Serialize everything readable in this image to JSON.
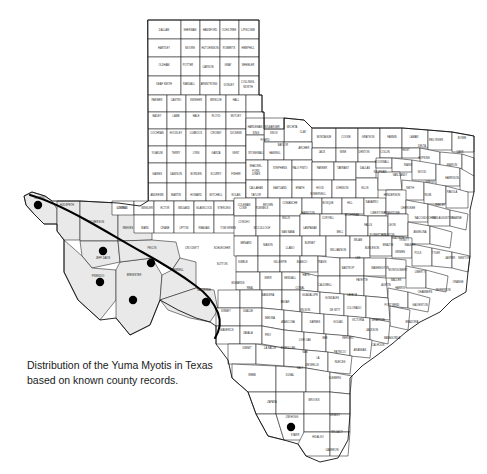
{
  "figure": {
    "caption_line1": "Distribution of the Yuma Myotis in Texas",
    "caption_line2": "based on known county records.",
    "caption_full": "Distribution of the Yuma Myotis in Texas\nbased on known county records.",
    "species": "Yuma Myotis",
    "region": "Texas",
    "background_color": "#ffffff",
    "shaded_range_color": "#e9e9e9",
    "county_line_color": "#1a1a1a",
    "record_dot_color": "#000000",
    "range_boundary_color": "#000000"
  },
  "map": {
    "title": "Texas county map",
    "type": "distribution-map",
    "shaded_range_label": "Presumed distribution (shaded)",
    "dot_legend_label": "Known county record"
  },
  "record_dots": [
    {
      "county": "El Paso",
      "x": 38,
      "y": 205,
      "r": 4.2
    },
    {
      "county": "Jeff Davis",
      "x": 103,
      "y": 251,
      "r": 4.2
    },
    {
      "county": "Presidio",
      "x": 100,
      "y": 282,
      "r": 4.2
    },
    {
      "county": "Brewster",
      "x": 133,
      "y": 300,
      "r": 4.2
    },
    {
      "county": "Pecos",
      "x": 151,
      "y": 263,
      "r": 4.2
    },
    {
      "county": "Val Verde",
      "x": 206,
      "y": 302,
      "r": 4.2
    },
    {
      "county": "Starr",
      "x": 291,
      "y": 427,
      "r": 4.2
    }
  ],
  "shaded_counties": [
    "El Paso",
    "Hudspeth",
    "Culberson",
    "Jeff Davis",
    "Presidio",
    "Brewster",
    "Pecos",
    "Terrell",
    "Val Verde"
  ],
  "county_labels": [
    {
      "name": "DALLAM",
      "x": 164,
      "y": 30
    },
    {
      "name": "SHERMAN",
      "x": 190,
      "y": 30
    },
    {
      "name": "HANSFORD",
      "x": 210,
      "y": 30
    },
    {
      "name": "OCHILTREE",
      "x": 229,
      "y": 30
    },
    {
      "name": "LIPSCOMB",
      "x": 248,
      "y": 30
    },
    {
      "name": "HARTLEY",
      "x": 164,
      "y": 48
    },
    {
      "name": "MOORE",
      "x": 190,
      "y": 48
    },
    {
      "name": "HUTCHINSON",
      "x": 210,
      "y": 48
    },
    {
      "name": "ROBERTS",
      "x": 229,
      "y": 48
    },
    {
      "name": "HEMPHILL",
      "x": 248,
      "y": 48
    },
    {
      "name": "OLDHAM",
      "x": 164,
      "y": 65
    },
    {
      "name": "POTTER",
      "x": 188,
      "y": 65
    },
    {
      "name": "CARSON",
      "x": 208,
      "y": 67
    },
    {
      "name": "GRAY",
      "x": 228,
      "y": 65
    },
    {
      "name": "WHEELER",
      "x": 248,
      "y": 65
    },
    {
      "name": "DEAF SMITH",
      "x": 164,
      "y": 84
    },
    {
      "name": "RANDALL",
      "x": 189,
      "y": 84
    },
    {
      "name": "ARMSTRONG",
      "x": 209,
      "y": 84
    },
    {
      "name": "DONLEY",
      "x": 229,
      "y": 85
    },
    {
      "name": "COLLINGS-",
      "x": 248,
      "y": 82
    },
    {
      "name": "WORTH",
      "x": 248,
      "y": 87
    },
    {
      "name": "PARMER",
      "x": 157,
      "y": 100
    },
    {
      "name": "CASTRO",
      "x": 176,
      "y": 100
    },
    {
      "name": "SWISHER",
      "x": 196,
      "y": 100
    },
    {
      "name": "BRISCOE",
      "x": 216,
      "y": 100
    },
    {
      "name": "HALL",
      "x": 236,
      "y": 100
    },
    {
      "name": "BAILEY",
      "x": 157,
      "y": 116
    },
    {
      "name": "LAMB",
      "x": 176,
      "y": 116
    },
    {
      "name": "HALE",
      "x": 196,
      "y": 116
    },
    {
      "name": "FLOYD",
      "x": 216,
      "y": 116
    },
    {
      "name": "MOTLEY",
      "x": 236,
      "y": 116
    },
    {
      "name": "COCHRAN",
      "x": 157,
      "y": 133
    },
    {
      "name": "HOCKLEY",
      "x": 176,
      "y": 133
    },
    {
      "name": "LUBBOCK",
      "x": 196,
      "y": 133
    },
    {
      "name": "CROSBY",
      "x": 216,
      "y": 133
    },
    {
      "name": "DICKENS",
      "x": 236,
      "y": 133
    },
    {
      "name": "KING",
      "x": 256,
      "y": 133
    },
    {
      "name": "KNOX",
      "x": 274,
      "y": 133
    },
    {
      "name": "YOAKUM",
      "x": 157,
      "y": 153
    },
    {
      "name": "TERRY",
      "x": 176,
      "y": 153
    },
    {
      "name": "LYNN",
      "x": 196,
      "y": 153
    },
    {
      "name": "GARZA",
      "x": 216,
      "y": 153
    },
    {
      "name": "KENT",
      "x": 236,
      "y": 153
    },
    {
      "name": "STONEWALL",
      "x": 256,
      "y": 153
    },
    {
      "name": "HASKELL",
      "x": 275,
      "y": 153
    },
    {
      "name": "GAINES",
      "x": 157,
      "y": 174
    },
    {
      "name": "DAWSON",
      "x": 176,
      "y": 174
    },
    {
      "name": "BORDEN",
      "x": 196,
      "y": 174
    },
    {
      "name": "SCURRY",
      "x": 216,
      "y": 174
    },
    {
      "name": "FISHER",
      "x": 236,
      "y": 174
    },
    {
      "name": "JONES",
      "x": 256,
      "y": 174
    },
    {
      "name": "ANDREWS",
      "x": 157,
      "y": 195
    },
    {
      "name": "MARTIN",
      "x": 176,
      "y": 195
    },
    {
      "name": "HOWARD",
      "x": 196,
      "y": 195
    },
    {
      "name": "MITCHELL",
      "x": 216,
      "y": 195
    },
    {
      "name": "NOLAN",
      "x": 236,
      "y": 195
    },
    {
      "name": "TAYLOR",
      "x": 256,
      "y": 195
    },
    {
      "name": "EL PASO",
      "x": 40,
      "y": 198
    },
    {
      "name": "HUDSPETH",
      "x": 67,
      "y": 205
    },
    {
      "name": "CULBERSON",
      "x": 96,
      "y": 222
    },
    {
      "name": "REEVES",
      "x": 128,
      "y": 228
    },
    {
      "name": "LOVING",
      "x": 122,
      "y": 208
    },
    {
      "name": "WINKLER",
      "x": 147,
      "y": 208
    },
    {
      "name": "WARD",
      "x": 145,
      "y": 228
    },
    {
      "name": "ECTOR",
      "x": 165,
      "y": 208
    },
    {
      "name": "MIDLAND",
      "x": 184,
      "y": 208
    },
    {
      "name": "GLASSCOCK",
      "x": 204,
      "y": 208
    },
    {
      "name": "STERLING",
      "x": 224,
      "y": 208
    },
    {
      "name": "COKE",
      "x": 243,
      "y": 208
    },
    {
      "name": "RUNNELS",
      "x": 262,
      "y": 208
    },
    {
      "name": "CRANE",
      "x": 165,
      "y": 228
    },
    {
      "name": "UPTON",
      "x": 184,
      "y": 228
    },
    {
      "name": "REAGAN",
      "x": 204,
      "y": 228
    },
    {
      "name": "TOM GREEN",
      "x": 228,
      "y": 228
    },
    {
      "name": "JEFF DAVIS",
      "x": 103,
      "y": 258
    },
    {
      "name": "PRESIDIO",
      "x": 98,
      "y": 276
    },
    {
      "name": "BREWSTER",
      "x": 134,
      "y": 275
    },
    {
      "name": "PECOS",
      "x": 152,
      "y": 248
    },
    {
      "name": "CROCKETT",
      "x": 192,
      "y": 248
    },
    {
      "name": "SCHLEICHER",
      "x": 222,
      "y": 248
    },
    {
      "name": "SUTTON",
      "x": 222,
      "y": 264
    },
    {
      "name": "TERRELL",
      "x": 178,
      "y": 270
    },
    {
      "name": "VAL VERDE",
      "x": 204,
      "y": 290
    },
    {
      "name": "KIMBLE",
      "x": 243,
      "y": 262
    },
    {
      "name": "EDWARDS",
      "x": 238,
      "y": 283
    },
    {
      "name": "KINNEY",
      "x": 226,
      "y": 311
    },
    {
      "name": "UVALDE",
      "x": 248,
      "y": 311
    },
    {
      "name": "MEDINA",
      "x": 270,
      "y": 318
    },
    {
      "name": "MAVERICK",
      "x": 227,
      "y": 330
    },
    {
      "name": "ZAVALA",
      "x": 248,
      "y": 333
    },
    {
      "name": "FRIO",
      "x": 268,
      "y": 335
    },
    {
      "name": "DIMMIT",
      "x": 247,
      "y": 348
    },
    {
      "name": "LA SALLE",
      "x": 270,
      "y": 348
    },
    {
      "name": "WEBB",
      "x": 252,
      "y": 375
    },
    {
      "name": "DUVAL",
      "x": 290,
      "y": 375
    },
    {
      "name": "ZAPATA",
      "x": 272,
      "y": 402
    },
    {
      "name": "JIM HOGG",
      "x": 292,
      "y": 417
    },
    {
      "name": "STARR",
      "x": 295,
      "y": 435
    },
    {
      "name": "BROOKS",
      "x": 314,
      "y": 400
    },
    {
      "name": "HIDALGO",
      "x": 318,
      "y": 437
    },
    {
      "name": "KENEDY",
      "x": 335,
      "y": 415
    },
    {
      "name": "WILLACY",
      "x": 337,
      "y": 432
    },
    {
      "name": "CAMERON",
      "x": 332,
      "y": 450
    },
    {
      "name": "COLORADO",
      "x": 354,
      "y": 308
    },
    {
      "name": "WHARTON",
      "x": 378,
      "y": 320
    },
    {
      "name": "MATAGORDA",
      "x": 392,
      "y": 338
    },
    {
      "name": "BRAZORIA",
      "x": 412,
      "y": 322
    },
    {
      "name": "FORT BEND",
      "x": 392,
      "y": 305
    },
    {
      "name": "HARRIS",
      "x": 400,
      "y": 288
    },
    {
      "name": "GALVESTON",
      "x": 420,
      "y": 305
    },
    {
      "name": "MONTGOMERY",
      "x": 398,
      "y": 270
    },
    {
      "name": "LIBERTY",
      "x": 420,
      "y": 272
    },
    {
      "name": "POLK",
      "x": 418,
      "y": 253
    },
    {
      "name": "TYLER",
      "x": 436,
      "y": 253
    },
    {
      "name": "JASPER",
      "x": 450,
      "y": 258
    },
    {
      "name": "NEWTON",
      "x": 464,
      "y": 258
    },
    {
      "name": "ORANGE",
      "x": 458,
      "y": 282
    },
    {
      "name": "JEFFERSON",
      "x": 443,
      "y": 290
    },
    {
      "name": "CHAMBERS",
      "x": 425,
      "y": 292
    },
    {
      "name": "TRINITY",
      "x": 404,
      "y": 240
    },
    {
      "name": "HOUSTON",
      "x": 388,
      "y": 235
    },
    {
      "name": "ANGELINA",
      "x": 420,
      "y": 232
    },
    {
      "name": "NACOGDOCHES",
      "x": 425,
      "y": 218
    },
    {
      "name": "SAN AUGUSTINE",
      "x": 443,
      "y": 218
    },
    {
      "name": "SABINE",
      "x": 457,
      "y": 218
    },
    {
      "name": "SHELBY",
      "x": 440,
      "y": 205
    },
    {
      "name": "PANOLA",
      "x": 452,
      "y": 192
    },
    {
      "name": "RUSK",
      "x": 428,
      "y": 195
    },
    {
      "name": "CHEROKEE",
      "x": 408,
      "y": 208
    },
    {
      "name": "SMITH",
      "x": 410,
      "y": 188
    },
    {
      "name": "GREGG",
      "x": 430,
      "y": 182
    },
    {
      "name": "HARRISON",
      "x": 452,
      "y": 178
    },
    {
      "name": "MARION",
      "x": 452,
      "y": 165
    },
    {
      "name": "CASS",
      "x": 460,
      "y": 152
    },
    {
      "name": "BOWIE",
      "x": 462,
      "y": 138
    },
    {
      "name": "RED RIVER",
      "x": 436,
      "y": 140
    },
    {
      "name": "LAMAR",
      "x": 414,
      "y": 137
    },
    {
      "name": "FANNIN",
      "x": 392,
      "y": 137
    },
    {
      "name": "GRAYSON",
      "x": 368,
      "y": 137
    },
    {
      "name": "COOKE",
      "x": 346,
      "y": 137
    },
    {
      "name": "MONTAGUE",
      "x": 324,
      "y": 137
    },
    {
      "name": "CLAY",
      "x": 303,
      "y": 132
    },
    {
      "name": "WICHITA",
      "x": 292,
      "y": 127
    },
    {
      "name": "WILBARGER",
      "x": 272,
      "y": 127
    },
    {
      "name": "HARDEMAN",
      "x": 255,
      "y": 127
    },
    {
      "name": "FOARD",
      "x": 265,
      "y": 140
    },
    {
      "name": "BAYLOR",
      "x": 283,
      "y": 145
    },
    {
      "name": "ARCHER",
      "x": 304,
      "y": 148
    },
    {
      "name": "JACK",
      "x": 322,
      "y": 152
    },
    {
      "name": "WISE",
      "x": 343,
      "y": 152
    },
    {
      "name": "DENTON",
      "x": 364,
      "y": 152
    },
    {
      "name": "COLLIN",
      "x": 385,
      "y": 152
    },
    {
      "name": "HUNT",
      "x": 406,
      "y": 150
    },
    {
      "name": "DELTA",
      "x": 422,
      "y": 146
    },
    {
      "name": "HOPKINS",
      "x": 424,
      "y": 158
    },
    {
      "name": "RAINS",
      "x": 408,
      "y": 165
    },
    {
      "name": "WOOD",
      "x": 422,
      "y": 172
    },
    {
      "name": "VAN ZANDT",
      "x": 400,
      "y": 175
    },
    {
      "name": "KAUFMAN",
      "x": 380,
      "y": 172
    },
    {
      "name": "ROCKWALL",
      "x": 382,
      "y": 162
    },
    {
      "name": "DALLAS",
      "x": 365,
      "y": 168
    },
    {
      "name": "TARRANT",
      "x": 343,
      "y": 168
    },
    {
      "name": "PARKER",
      "x": 322,
      "y": 168
    },
    {
      "name": "PALO PINTO",
      "x": 300,
      "y": 168
    },
    {
      "name": "STEPHENS",
      "x": 280,
      "y": 168
    },
    {
      "name": "SHACKEL-",
      "x": 256,
      "y": 166
    },
    {
      "name": "FORD",
      "x": 256,
      "y": 171
    },
    {
      "name": "CALLAHAN",
      "x": 256,
      "y": 188
    },
    {
      "name": "EASTLAND",
      "x": 280,
      "y": 188
    },
    {
      "name": "ERATH",
      "x": 300,
      "y": 188
    },
    {
      "name": "HOOD",
      "x": 320,
      "y": 188
    },
    {
      "name": "JOHNSON",
      "x": 342,
      "y": 188
    },
    {
      "name": "ELLIS",
      "x": 365,
      "y": 188
    },
    {
      "name": "HENDERSON",
      "x": 392,
      "y": 195
    },
    {
      "name": "NAVARRO",
      "x": 372,
      "y": 202
    },
    {
      "name": "HILL",
      "x": 350,
      "y": 203
    },
    {
      "name": "BOSQUE",
      "x": 328,
      "y": 203
    },
    {
      "name": "SOMERVELL",
      "x": 318,
      "y": 194
    },
    {
      "name": "COMANCHE",
      "x": 290,
      "y": 203
    },
    {
      "name": "BROWN",
      "x": 268,
      "y": 205
    },
    {
      "name": "COLEMAN",
      "x": 244,
      "y": 205
    },
    {
      "name": "MILLS",
      "x": 286,
      "y": 218
    },
    {
      "name": "HAMILTON",
      "x": 308,
      "y": 213
    },
    {
      "name": "CORYELL",
      "x": 328,
      "y": 218
    },
    {
      "name": "MCLENNAN",
      "x": 352,
      "y": 215
    },
    {
      "name": "FALLS",
      "x": 368,
      "y": 225
    },
    {
      "name": "LIMESTONE",
      "x": 378,
      "y": 213
    },
    {
      "name": "FREESTONE",
      "x": 392,
      "y": 213
    },
    {
      "name": "LEON",
      "x": 392,
      "y": 225
    },
    {
      "name": "ROBERTSON",
      "x": 378,
      "y": 235
    },
    {
      "name": "MILAM",
      "x": 358,
      "y": 240
    },
    {
      "name": "BELL",
      "x": 340,
      "y": 232
    },
    {
      "name": "LAMPASAS",
      "x": 310,
      "y": 228
    },
    {
      "name": "BURNET",
      "x": 310,
      "y": 243
    },
    {
      "name": "SAN SABA",
      "x": 288,
      "y": 232
    },
    {
      "name": "MCCULLOCH",
      "x": 262,
      "y": 228
    },
    {
      "name": "CONCHO",
      "x": 244,
      "y": 222
    },
    {
      "name": "MENARD",
      "x": 246,
      "y": 243
    },
    {
      "name": "MASON",
      "x": 268,
      "y": 245
    },
    {
      "name": "LLANO",
      "x": 290,
      "y": 248
    },
    {
      "name": "WILLIAMSON",
      "x": 338,
      "y": 250
    },
    {
      "name": "BURLESON",
      "x": 372,
      "y": 248
    },
    {
      "name": "BRAZOS",
      "x": 388,
      "y": 245
    },
    {
      "name": "GRIMES",
      "x": 400,
      "y": 252
    },
    {
      "name": "WALKER",
      "x": 410,
      "y": 245
    },
    {
      "name": "MADISON",
      "x": 398,
      "y": 238
    },
    {
      "name": "TRAVIS",
      "x": 322,
      "y": 262
    },
    {
      "name": "BASTROP",
      "x": 348,
      "y": 268
    },
    {
      "name": "LEE",
      "x": 358,
      "y": 258
    },
    {
      "name": "FAYETTE",
      "x": 362,
      "y": 280
    },
    {
      "name": "WASHINGTON",
      "x": 380,
      "y": 268
    },
    {
      "name": "AUSTIN",
      "x": 386,
      "y": 285
    },
    {
      "name": "WALLER",
      "x": 396,
      "y": 280
    },
    {
      "name": "HAYS",
      "x": 306,
      "y": 275
    },
    {
      "name": "BLANCO",
      "x": 302,
      "y": 262
    },
    {
      "name": "GILLESPIE",
      "x": 280,
      "y": 262
    },
    {
      "name": "KERR",
      "x": 268,
      "y": 278
    },
    {
      "name": "KENDALL",
      "x": 290,
      "y": 278
    },
    {
      "name": "COMAL",
      "x": 300,
      "y": 288
    },
    {
      "name": "BANDERA",
      "x": 268,
      "y": 295
    },
    {
      "name": "REAL",
      "x": 250,
      "y": 288
    },
    {
      "name": "BEXAR",
      "x": 285,
      "y": 302
    },
    {
      "name": "GUADALUPE",
      "x": 310,
      "y": 295
    },
    {
      "name": "CALDWELL",
      "x": 325,
      "y": 285
    },
    {
      "name": "GONZALES",
      "x": 332,
      "y": 298
    },
    {
      "name": "LAVACA",
      "x": 352,
      "y": 295
    },
    {
      "name": "DE WITT",
      "x": 335,
      "y": 310
    },
    {
      "name": "WILSON",
      "x": 305,
      "y": 310
    },
    {
      "name": "ATASCOSA",
      "x": 288,
      "y": 322
    },
    {
      "name": "KARNES",
      "x": 315,
      "y": 322
    },
    {
      "name": "GOLIAD",
      "x": 338,
      "y": 322
    },
    {
      "name": "VICTORIA",
      "x": 358,
      "y": 320
    },
    {
      "name": "JACKSON",
      "x": 372,
      "y": 330
    },
    {
      "name": "CALHOUN",
      "x": 378,
      "y": 345
    },
    {
      "name": "REFUGIO",
      "x": 348,
      "y": 338
    },
    {
      "name": "BEE",
      "x": 325,
      "y": 338
    },
    {
      "name": "LIVE OAK",
      "x": 305,
      "y": 340
    },
    {
      "name": "MCMULLEN",
      "x": 288,
      "y": 348
    },
    {
      "name": "SAN",
      "x": 305,
      "y": 352
    },
    {
      "name": "PATRICIO",
      "x": 340,
      "y": 352
    },
    {
      "name": "ARANSAS",
      "x": 360,
      "y": 350
    },
    {
      "name": "NUECES",
      "x": 340,
      "y": 362
    },
    {
      "name": "JIM WELLS",
      "x": 312,
      "y": 365
    },
    {
      "name": "KLEBERG",
      "x": 335,
      "y": 378
    },
    {
      "name": "LA",
      "x": 318,
      "y": 358
    },
    {
      "name": "SALT",
      "x": 300,
      "y": 368
    },
    {
      "name": "LOVING2",
      "x": 122,
      "y": 208
    }
  ]
}
